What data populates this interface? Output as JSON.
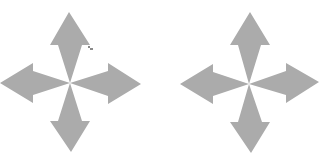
{
  "canvas": {
    "width": 328,
    "height": 167,
    "background": "#ffffff"
  },
  "icons": [
    {
      "name": "move-arrows-icon",
      "color": "#ababab",
      "center": [
        70,
        83
      ],
      "tips": {
        "up": [
          69,
          12
        ],
        "down": [
          71,
          152
        ],
        "left": [
          0,
          83
        ],
        "right": [
          141,
          84
        ]
      },
      "has_cursor_artifact": true
    },
    {
      "name": "move-arrows-icon",
      "color": "#ababab",
      "center": [
        85,
        84
      ],
      "tips": {
        "up": [
          86,
          12
        ],
        "down": [
          87,
          153
        ],
        "left": [
          16,
          84
        ],
        "right": [
          155,
          82
        ]
      },
      "has_cursor_artifact": false
    }
  ]
}
